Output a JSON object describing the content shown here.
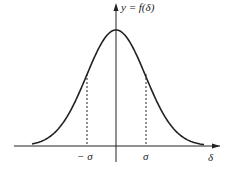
{
  "diagram": {
    "y_axis_label": "y = f(δ)",
    "x_axis_label": "δ",
    "tick_labels": [
      "− σ",
      "σ"
    ],
    "line_color": "#222222",
    "curve": {
      "type": "gaussian",
      "mean": 0,
      "marked_points": [
        "-σ",
        "σ"
      ],
      "dashed_verticals": true
    }
  },
  "chart_data": {
    "type": "line",
    "title": "",
    "xlabel": "δ",
    "ylabel": "y = f(δ)",
    "x": [
      -3,
      -2,
      -1,
      0,
      1,
      2,
      3
    ],
    "series": [
      {
        "name": "f(δ)",
        "values": [
          0.011,
          0.135,
          0.607,
          1.0,
          0.607,
          0.135,
          0.011
        ]
      }
    ],
    "annotations": [
      "−σ",
      "σ"
    ],
    "grid": false
  }
}
